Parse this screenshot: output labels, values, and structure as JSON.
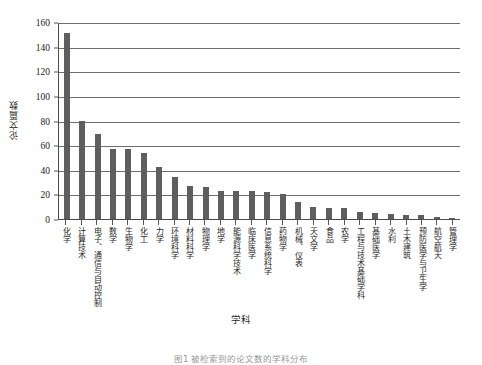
{
  "chart_data": {
    "type": "bar",
    "title": "",
    "xlabel": "学科",
    "ylabel": "论文篇数",
    "ylim": [
      0,
      160
    ],
    "ytick_step": 20,
    "yticks": [
      "0",
      "20",
      "40",
      "60",
      "80",
      "100",
      "120",
      "140",
      "160"
    ],
    "grid": true,
    "legend": null,
    "bar_color": "#5e5e5e",
    "categories": [
      "化学",
      "计算技术",
      "电子、通信与自动控制",
      "数学",
      "生物学",
      "化工",
      "力学",
      "环境科学",
      "材料科学",
      "物理学",
      "地学",
      "能源科学技术",
      "临床医学",
      "信息系统科学",
      "药物学",
      "机械、仪表",
      "天文学",
      "食品",
      "农学",
      "工程与技术基础学科",
      "基础医学",
      "水利",
      "土木建筑",
      "预防医学与卫生学",
      "航空航天",
      "管理学"
    ],
    "values": [
      151,
      80,
      69,
      57,
      57,
      54,
      42,
      34,
      27,
      26,
      23,
      23,
      23,
      22,
      20,
      14,
      10,
      9,
      9,
      6,
      5,
      4,
      3,
      3,
      2,
      1
    ]
  },
  "caption": {
    "text": "图1  被检索到的论文数的学科分布"
  }
}
